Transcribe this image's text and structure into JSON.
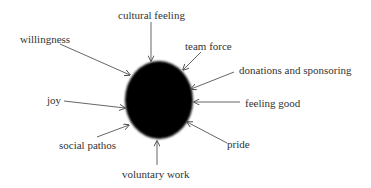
{
  "diagram": {
    "type": "radial-concept-map",
    "center": {
      "shape": "ellipse",
      "fill": "#000000",
      "label": ""
    },
    "arrow_color": "#444444",
    "text_color": "#333333",
    "labels": {
      "cultural_feeling": "cultural feeling",
      "willingness": "willingness",
      "team_force": "team force",
      "donations_and_sponsoring": "donations and sponsoring",
      "joy": "joy",
      "feeling_good": "feeling good",
      "social_pathos": "social pathos",
      "pride": "pride",
      "voluntary_work": "voluntary work"
    },
    "arrows_point_to": "center"
  }
}
